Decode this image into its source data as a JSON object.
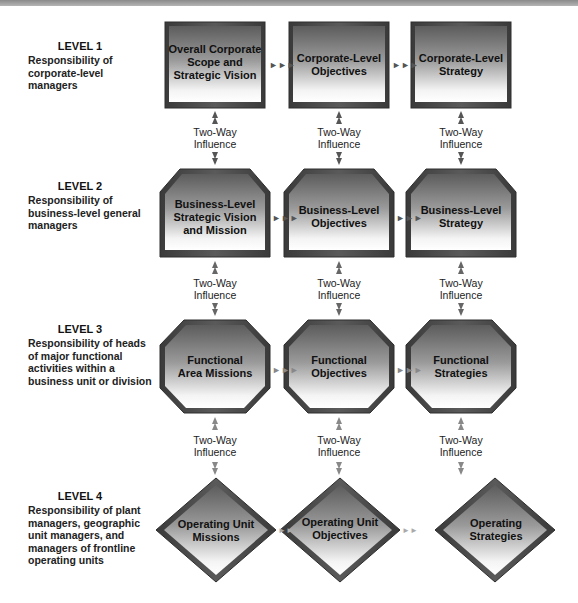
{
  "levels": [
    {
      "title": "LEVEL 1",
      "description": [
        "Responsibility of",
        "corporate-level",
        "managers"
      ]
    },
    {
      "title": "LEVEL 2",
      "description": [
        "Responsibility of",
        "business-level general",
        "managers"
      ]
    },
    {
      "title": "LEVEL 3",
      "description": [
        "Responsibility of heads",
        "of major functional",
        "activities within a",
        "business unit or division"
      ]
    },
    {
      "title": "LEVEL 4",
      "description": [
        "Responsibility of plant",
        "managers, geographic",
        "unit managers, and",
        "managers of frontline",
        "operating units"
      ]
    }
  ],
  "rows": [
    {
      "shape": "rectangle",
      "nodes": [
        {
          "lines": [
            "Overall Corporate",
            "Scope and",
            "Strategic Vision"
          ]
        },
        {
          "lines": [
            "Corporate-Level",
            "Objectives"
          ]
        },
        {
          "lines": [
            "Corporate-Level",
            "Strategy"
          ]
        }
      ]
    },
    {
      "shape": "shield",
      "nodes": [
        {
          "lines": [
            "Business-Level",
            "Strategic Vision",
            "and Mission"
          ]
        },
        {
          "lines": [
            "Business-Level",
            "Objectives"
          ]
        },
        {
          "lines": [
            "Business-Level",
            "Strategy"
          ]
        }
      ]
    },
    {
      "shape": "octagon",
      "nodes": [
        {
          "lines": [
            "Functional",
            "Area Missions"
          ]
        },
        {
          "lines": [
            "Functional",
            "Objectives"
          ]
        },
        {
          "lines": [
            "Functional",
            "Strategies"
          ]
        }
      ]
    },
    {
      "shape": "diamond",
      "nodes": [
        {
          "lines": [
            "Operating Unit",
            "Missions"
          ]
        },
        {
          "lines": [
            "Operating Unit",
            "Objectives"
          ]
        },
        {
          "lines": [
            "Operating",
            "Strategies"
          ]
        }
      ]
    }
  ],
  "connector_label": [
    "Two-Way",
    "Influence"
  ],
  "horizontal_arrow_glyph": "►►►",
  "colors": {
    "shape_dark": "#5a5a5a",
    "shape_light": "#f4f4f4",
    "border": "#2e2e2e",
    "arrow": "#666666"
  }
}
